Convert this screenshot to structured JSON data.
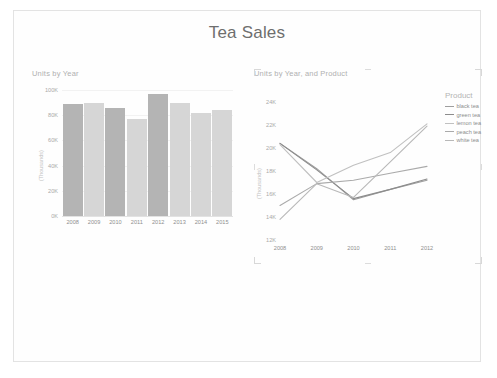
{
  "report": {
    "title": "Tea Sales"
  },
  "bar_card": {
    "title": "Units by Year"
  },
  "line_card": {
    "title": "Units by Year, and Product"
  },
  "legend": {
    "title": "Product"
  },
  "colors": {
    "bar_dark": "#b4b4b4",
    "bar_light": "#d6d6d6",
    "page_bg": "#fefefe",
    "page_border": "#e6e6e6",
    "title_text": "#6e6e6e",
    "axis_text": "#a9a9a9",
    "card_title_text": "#b0b0b0",
    "gridline": "#f2f2f2"
  },
  "chart_data": [
    {
      "type": "bar",
      "title": "Units by Year",
      "xlabel": "",
      "ylabel": "(Thousands)",
      "categories": [
        "2008",
        "2009",
        "2010",
        "2011",
        "2012",
        "2013",
        "2014",
        "2015"
      ],
      "values": [
        89000,
        90000,
        86000,
        77000,
        97000,
        90000,
        82000,
        84000
      ],
      "bar_colors": [
        "#b4b4b4",
        "#d6d6d6",
        "#b4b4b4",
        "#d6d6d6",
        "#b4b4b4",
        "#d6d6d6",
        "#d6d6d6",
        "#d6d6d6"
      ],
      "ylim": [
        0,
        100000
      ],
      "yticks": [
        0,
        20000,
        40000,
        60000,
        80000,
        100000
      ],
      "ytick_labels": [
        "0K",
        "20K",
        "40K",
        "60K",
        "80K",
        "100K"
      ],
      "grid": true,
      "legend": "none"
    },
    {
      "type": "line",
      "title": "Units by Year, and Product",
      "xlabel": "",
      "ylabel": "(Thousands)",
      "x": [
        "2008",
        "2009",
        "2010",
        "2011",
        "2012"
      ],
      "series": [
        {
          "name": "black tea",
          "color": "#9e9e9e",
          "values": [
            20400,
            18200,
            15500,
            16400,
            17200
          ]
        },
        {
          "name": "green tea",
          "color": "#8c8c8c",
          "values": [
            20400,
            18100,
            15600,
            16400,
            17300
          ]
        },
        {
          "name": "lemon tea",
          "color": "#c0c0c0",
          "values": [
            20300,
            17000,
            18500,
            19600,
            22100
          ]
        },
        {
          "name": "peach tea",
          "color": "#aaaaaa",
          "values": [
            15000,
            16900,
            17200,
            17800,
            18400
          ]
        },
        {
          "name": "white tea",
          "color": "#b8b8b8",
          "values": [
            13800,
            16900,
            15700,
            18800,
            21900
          ]
        }
      ],
      "ylim": [
        12000,
        24000
      ],
      "yticks": [
        12000,
        14000,
        16000,
        18000,
        20000,
        22000,
        24000
      ],
      "ytick_labels": [
        "12K",
        "14K",
        "16K",
        "18K",
        "20K",
        "22K",
        "24K"
      ],
      "grid": false,
      "legend": "right",
      "legend_title": "Product"
    }
  ]
}
